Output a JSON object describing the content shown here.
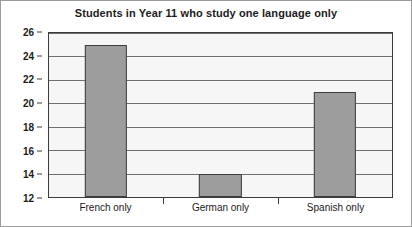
{
  "chart_data": {
    "type": "bar",
    "title": "Students in Year 11 who study one language only",
    "categories": [
      "French only",
      "German only",
      "Spanish only"
    ],
    "values": [
      25,
      14,
      21
    ],
    "xlabel": "",
    "ylabel": "",
    "ylim": [
      12,
      26
    ],
    "ytick_step": 2,
    "yticks": [
      12,
      14,
      16,
      18,
      20,
      22,
      24,
      26
    ],
    "ytick_labels": [
      "12",
      "14",
      "16",
      "18",
      "20",
      "22",
      "24",
      "26"
    ],
    "grid": true,
    "grid_axis": "y",
    "legend": false,
    "legend_position": "none",
    "bar_fill_color": "#9d9d9d",
    "bar_border_color": "#3d3d3d",
    "plot_background_color": "#f6f6f6",
    "gridline_color": "#6f6f6f",
    "axis_color": "#3c3c3c",
    "title_color": "#1b1b1b",
    "tick_label_color": "#1b1b1b",
    "figure_background_color": "#ffffff",
    "figure_border_color": "#9a9a9a"
  }
}
